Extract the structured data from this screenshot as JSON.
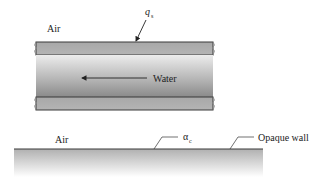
{
  "diagram": {
    "upper": {
      "air_label": "Air",
      "heat_flux_label": {
        "symbol": "q",
        "subscript": "s"
      },
      "fluid_label": "Water",
      "flow_direction": "left"
    },
    "lower": {
      "air_label": "Air",
      "absorptivity_label": {
        "symbol": "α",
        "subscript": "c"
      },
      "wall_label": "Opaque wall"
    },
    "colors": {
      "wall_fill": "#a9a9a9",
      "outline": "#3a3a3a",
      "water_light": "#e6e6e6",
      "water_dark": "#8e8e8e"
    }
  }
}
